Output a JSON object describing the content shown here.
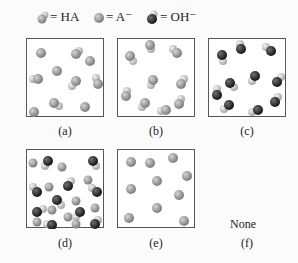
{
  "legend": [
    {
      "symbol": "HA-molecule",
      "text": "= HA"
    },
    {
      "symbol": "A-minus-ion",
      "text": "= A⁻"
    },
    {
      "symbol": "OH-minus-ion",
      "text": "= OH⁻"
    }
  ],
  "panels": [
    {
      "id": "a",
      "label": "(a)",
      "contents": "mixture of HA and A⁻"
    },
    {
      "id": "b",
      "label": "(b)",
      "contents": "HA only"
    },
    {
      "id": "c",
      "label": "(c)",
      "contents": "OH⁻ only"
    },
    {
      "id": "d",
      "label": "(d)",
      "contents": "A⁻, HA and OH⁻ mixture"
    },
    {
      "id": "e",
      "label": "(e)",
      "contents": "A⁻ only"
    },
    {
      "id": "f",
      "label": "(f)",
      "text": "None"
    }
  ],
  "colors": {
    "gray_ball": "#8f8f8f",
    "light_ball": "#c9c9c9",
    "dark_ball": "#2e2e2e",
    "border": "#555555"
  }
}
